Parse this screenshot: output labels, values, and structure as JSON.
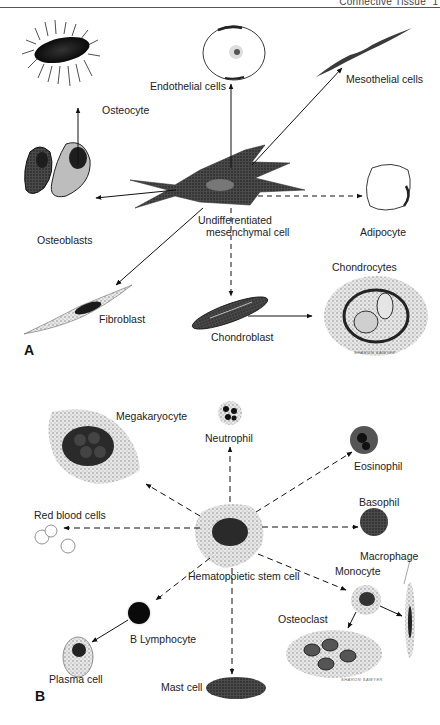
{
  "page": {
    "running_head": "Connective Tissue",
    "page_number": "1"
  },
  "figure": {
    "panel_a": {
      "label": "A",
      "center_cell": "Undifferentiated mesenchymal cell",
      "center_cell_lines": [
        "Undifferentiated",
        "mesenchymal cell"
      ],
      "cells": {
        "osteocyte": "Osteocyte",
        "endothelial": "Endothelial cells",
        "mesothelial": "Mesothelial cells",
        "osteoblasts": "Osteoblasts",
        "adipocyte": "Adipocyte",
        "fibroblast": "Fibroblast",
        "chondroblast": "Chondroblast",
        "chondrocytes": "Chondrocytes"
      },
      "signature": "SHARON SAWYER"
    },
    "panel_b": {
      "label": "B",
      "center_cell": "Hematopoietic stem cell",
      "cells": {
        "megakaryocyte": "Megakaryocyte",
        "neutrophil": "Neutrophil",
        "eosinophil": "Eosinophil",
        "basophil": "Basophil",
        "red_blood_cells": "Red blood cells",
        "macrophage": "Macrophage",
        "monocyte": "Monocyte",
        "osteoclast": "Osteoclast",
        "b_lymphocyte": "B Lymphocyte",
        "plasma_cell": "Plasma cell",
        "mast_cell": "Mast cell"
      },
      "signature": "SHARON SAWYER"
    },
    "legend_semantics": {
      "solid_arrow": "direct differentiation",
      "dashed_arrow": "indirect / multistep differentiation"
    }
  }
}
